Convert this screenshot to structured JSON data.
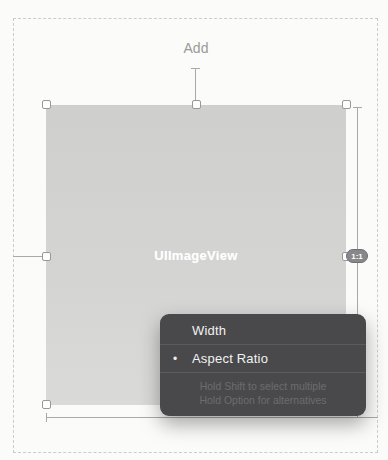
{
  "canvas": {
    "add_label": "Add",
    "image_view": {
      "label": "UIImageView",
      "bg_color": "#d2d2d0"
    },
    "aspect_badge": {
      "label": "1:1"
    }
  },
  "menu": {
    "bg_color": "#49494b",
    "selected_marker": "•",
    "items": [
      {
        "label": "Width",
        "selected": false
      },
      {
        "label": "Aspect Ratio",
        "selected": true
      }
    ],
    "hints": [
      "Hold Shift to select multiple",
      "Hold Option for alternatives"
    ]
  },
  "colors": {
    "canvas_bg": "#fbfbfa",
    "dashed_border": "#cccccb",
    "handle_border": "#989896",
    "dimension_line": "#a9a9a7",
    "label_gray": "#9a9a98",
    "menu_text": "#f2f2f2",
    "menu_hint_text": "#6c6c6e",
    "badge_bg": "#88888a"
  }
}
